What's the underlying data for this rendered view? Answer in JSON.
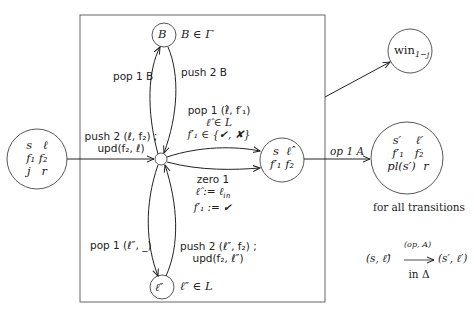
{
  "diagram": {
    "type": "automaton-gadget",
    "nodes": {
      "start": {
        "row1": [
          "s",
          "ℓ"
        ],
        "row2": [
          "f₁",
          "f₂"
        ],
        "row3": [
          "j",
          "r"
        ]
      },
      "top": {
        "label": "B",
        "annotation": "B ∈ Γ"
      },
      "bottom": {
        "label": "ℓ″",
        "annotation": "ℓ″ ∈ L"
      },
      "mid": {
        "row1": [
          "s",
          "ℓ̂"
        ],
        "row2": [
          "f′₁",
          "f₂"
        ]
      },
      "win": {
        "label": "win",
        "sub": "1−j"
      },
      "target": {
        "row1": [
          "s′",
          "ℓ′"
        ],
        "row2": [
          "f′₁",
          "f₂"
        ],
        "row3": [
          "pl(s′)",
          "r"
        ]
      }
    },
    "edges": {
      "entry": {
        "line1": "push 2 (ℓ, f₂) ;",
        "line2": "upd(f₂, ℓ)"
      },
      "pop_B": "pop 1 B",
      "push_B": "push 2 B",
      "pop_hat": {
        "line1": "pop 1 (ℓ̂, f′₁)",
        "line2": "ℓ̂ ∈ L",
        "line3": "f′₁ ∈ {✔, ✘}"
      },
      "zero": {
        "line1": "zero 1",
        "line2": "ℓ̂ := ℓ",
        "line2_sub": "in",
        "line3": "f′₁ := ✔"
      },
      "pop_bottom": "pop 1 (ℓ″, _)",
      "push_bottom": {
        "line1": "push 2 (ℓ″, f₂) ;",
        "line2": "upd(f₂, ℓ″)"
      },
      "op": "op 1 A"
    },
    "caption": {
      "line1": "for all transitions",
      "lhs": "(s, ℓ̂)",
      "arrow_label": "(op, A)",
      "rhs": "(s′, ℓ′)",
      "line3": "in Δ"
    }
  }
}
